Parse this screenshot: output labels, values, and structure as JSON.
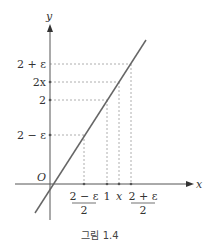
{
  "figure": {
    "caption": "그림 1.4",
    "axes": {
      "x_label": "x",
      "y_label": "y",
      "origin_label": "O"
    },
    "y_ticks": [
      {
        "label": "2 + ε",
        "y": 64
      },
      {
        "label": "2x",
        "y": 82
      },
      {
        "label": "2",
        "y": 100
      },
      {
        "label": "2 − ε",
        "y": 135
      }
    ],
    "x_ticks": [
      {
        "label_num": "2 − ε",
        "label_den": "2",
        "x": 84
      },
      {
        "label": "1",
        "x": 107
      },
      {
        "label": "x",
        "x": 119
      },
      {
        "label_num": "2 + ε",
        "label_den": "2",
        "x": 131
      }
    ],
    "line": {
      "description": "y = 2x",
      "color": "#666666"
    },
    "colors": {
      "axis": "#555555",
      "dash": "#999999"
    }
  }
}
